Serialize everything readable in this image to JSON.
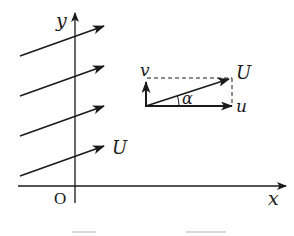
{
  "diagram": {
    "type": "uniform-flow-velocity-decomposition",
    "axes": {
      "x_label": "x",
      "y_label": "y",
      "origin_label": "O"
    },
    "flow": {
      "streamline_count": 4,
      "velocity_label": "U"
    },
    "decomposition": {
      "resultant_label": "U",
      "horizontal_label": "u",
      "vertical_label": "v",
      "angle_label": "α"
    },
    "colors": {
      "ink": "#1a1a1a",
      "background": "#ffffff"
    }
  }
}
